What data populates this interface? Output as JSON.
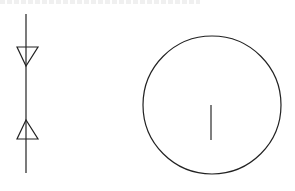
{
  "diagram": {
    "background": "#ffffff",
    "stroke_color": "#222222",
    "symbols": [
      {
        "name": "vertical-line-with-opposing-triangles",
        "line": {
          "x": 26,
          "y1": 14,
          "y2": 173
        },
        "triangles": [
          {
            "direction": "down",
            "base_y": 47,
            "base_x1": 17,
            "base_x2": 38,
            "apex": [
              26,
              66
            ]
          },
          {
            "direction": "up",
            "base_y": 139,
            "base_x1": 17,
            "base_x2": 38,
            "apex": [
              26,
              120
            ]
          }
        ]
      },
      {
        "name": "circle-with-vertical-tick",
        "circle": {
          "cx": 212,
          "cy": 105,
          "r": 69
        },
        "tick": {
          "x": 211,
          "y1": 105,
          "y2": 140
        }
      }
    ]
  }
}
